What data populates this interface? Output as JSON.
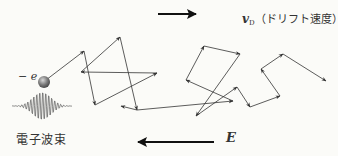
{
  "drift_velocity": {
    "symbol": "v",
    "subscript": "D",
    "description": "（ドリフト速度）"
  },
  "electron": {
    "charge_label": "− e"
  },
  "wave_packet": {
    "label": "電子波束"
  },
  "electric_field": {
    "symbol": "E"
  },
  "colors": {
    "line": "#333333",
    "electron_fill": "#7a7a7a",
    "background": "#fbfbf8"
  },
  "path_points": [
    [
      46,
      80
    ],
    [
      84,
      51
    ],
    [
      95,
      105
    ],
    [
      157,
      73
    ],
    [
      81,
      72
    ],
    [
      120,
      37
    ],
    [
      137,
      110
    ],
    [
      121,
      106
    ]
  ],
  "path_points_2": [
    [
      137,
      110
    ],
    [
      233,
      101
    ],
    [
      186,
      80
    ],
    [
      204,
      46
    ],
    [
      240,
      54
    ],
    [
      196,
      116
    ],
    [
      237,
      87
    ],
    [
      250,
      107
    ],
    [
      280,
      96
    ],
    [
      261,
      69
    ],
    [
      283,
      54
    ],
    [
      326,
      81
    ]
  ]
}
